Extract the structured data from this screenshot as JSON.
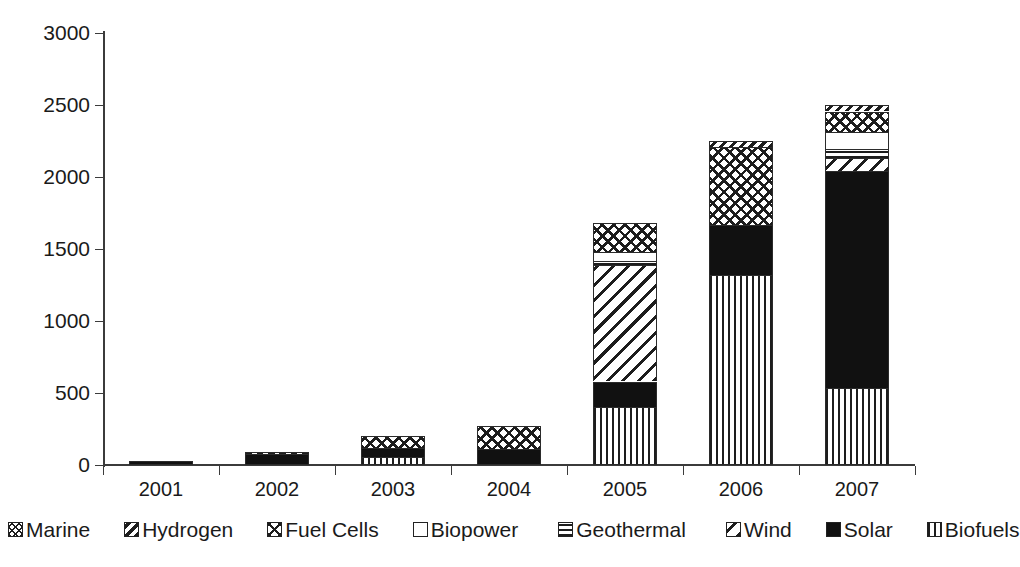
{
  "chart_data": {
    "type": "bar",
    "subtype": "stacked-bar",
    "title": "",
    "xlabel": "",
    "ylabel": "",
    "categories": [
      "2001",
      "2002",
      "2003",
      "2004",
      "2005",
      "2006",
      "2007"
    ],
    "ylim": [
      0,
      3000
    ],
    "yticks": [
      0,
      500,
      1000,
      1500,
      2000,
      2500,
      3000
    ],
    "ytick_labels": [
      "0",
      "500",
      "1000",
      "1500",
      "2000",
      "2500",
      "3000"
    ],
    "grid": false,
    "legend_position": "bottom",
    "stack_order_bottom_to_top": [
      "Biofuels",
      "Solar",
      "Wind",
      "Geothermal",
      "Biopower",
      "Fuel Cells",
      "Hydrogen",
      "Marine"
    ],
    "series": [
      {
        "name": "Biofuels",
        "pattern": "vertical-lines",
        "values": [
          0,
          0,
          55,
          0,
          400,
          1320,
          535
        ]
      },
      {
        "name": "Solar",
        "pattern": "solid-black",
        "values": [
          25,
          75,
          60,
          110,
          180,
          345,
          1510
        ]
      },
      {
        "name": "Wind",
        "pattern": "diagonal-lines",
        "values": [
          0,
          0,
          0,
          0,
          810,
          0,
          85
        ]
      },
      {
        "name": "Geothermal",
        "pattern": "horizontal-lines",
        "values": [
          0,
          0,
          0,
          0,
          30,
          0,
          65
        ]
      },
      {
        "name": "Biopower",
        "pattern": "empty-white",
        "values": [
          0,
          0,
          0,
          0,
          60,
          0,
          115
        ]
      },
      {
        "name": "Fuel Cells",
        "pattern": "cross-hatch",
        "values": [
          0,
          15,
          85,
          160,
          200,
          545,
          145
        ]
      },
      {
        "name": "Hydrogen",
        "pattern": "dense-diagonal",
        "values": [
          0,
          0,
          0,
          0,
          0,
          40,
          45
        ]
      },
      {
        "name": "Marine",
        "pattern": "fine-cross-hatch",
        "values": [
          0,
          0,
          0,
          0,
          0,
          0,
          0
        ]
      }
    ],
    "totals": [
      25,
      90,
      200,
      270,
      1680,
      2250,
      2500
    ]
  },
  "legend": {
    "items": [
      {
        "label": "Marine",
        "pattern": "fine-cross-hatch"
      },
      {
        "label": "Hydrogen",
        "pattern": "dense-diagonal"
      },
      {
        "label": "Fuel Cells",
        "pattern": "cross-hatch"
      },
      {
        "label": "Biopower",
        "pattern": "empty-white"
      },
      {
        "label": "Geothermal",
        "pattern": "horizontal-lines"
      },
      {
        "label": "Wind",
        "pattern": "diagonal-lines"
      },
      {
        "label": "Solar",
        "pattern": "solid-black"
      },
      {
        "label": "Biofuels",
        "pattern": "vertical-lines"
      }
    ]
  },
  "colors": {
    "axis": "#3b3b3b",
    "ink": "#1a1a1a",
    "fill_dark": "#111111",
    "background": "#ffffff"
  }
}
